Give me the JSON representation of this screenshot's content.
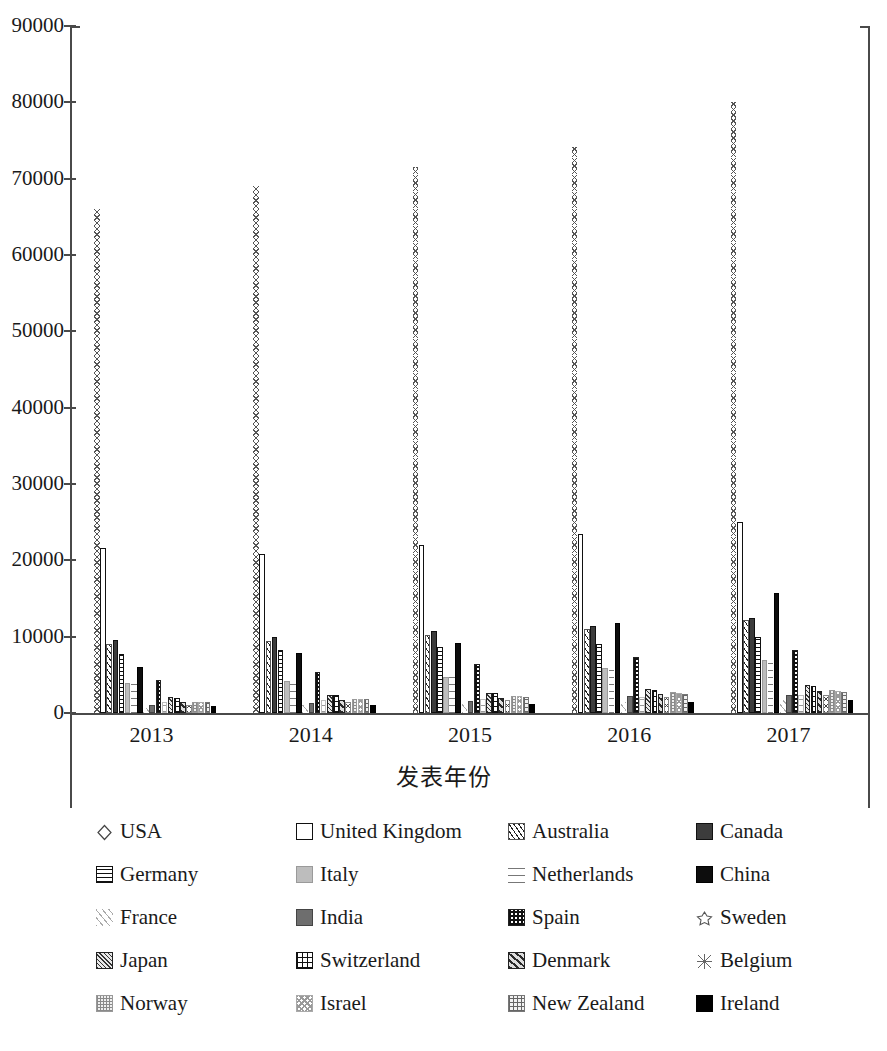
{
  "chart_data": {
    "type": "bar",
    "title": "",
    "xlabel": "发表年份",
    "ylabel": "",
    "categories": [
      "2013",
      "2014",
      "2015",
      "2016",
      "2017"
    ],
    "ylim": [
      0,
      90000
    ],
    "ytick_values": [
      0,
      10000,
      20000,
      30000,
      40000,
      50000,
      60000,
      70000,
      80000,
      90000
    ],
    "ytick_labels": [
      "0",
      "10000",
      "20000",
      "30000",
      "40000",
      "50000",
      "60000",
      "70000",
      "80000",
      "90000"
    ],
    "grid": false,
    "legend_position": "bottom",
    "series": [
      {
        "name": "USA",
        "values": [
          66000,
          69000,
          71500,
          74200,
          80000
        ]
      },
      {
        "name": "United Kingdom",
        "values": [
          21600,
          20800,
          22000,
          23500,
          25000
        ]
      },
      {
        "name": "Australia",
        "values": [
          9000,
          9400,
          10200,
          11000,
          12200
        ]
      },
      {
        "name": "Canada",
        "values": [
          9500,
          9900,
          10800,
          11400,
          12400
        ]
      },
      {
        "name": "Germany",
        "values": [
          7700,
          8200,
          8700,
          9100,
          9900
        ]
      },
      {
        "name": "Italy",
        "values": [
          3900,
          4200,
          4700,
          5900,
          6900
        ]
      },
      {
        "name": "Netherlands",
        "values": [
          4100,
          4400,
          4900,
          6000,
          7000
        ]
      },
      {
        "name": "China",
        "values": [
          6000,
          7900,
          9200,
          11800,
          15700
        ]
      },
      {
        "name": "France",
        "values": [
          700,
          1000,
          1300,
          1500,
          1700
        ]
      },
      {
        "name": "India",
        "values": [
          1100,
          1300,
          1600,
          2200,
          2300
        ]
      },
      {
        "name": "Spain",
        "values": [
          4300,
          5400,
          6400,
          7300,
          8200
        ]
      },
      {
        "name": "Sweden",
        "values": [
          1500,
          1700,
          1900,
          2100,
          2300
        ]
      },
      {
        "name": "Japan",
        "values": [
          2100,
          2300,
          2600,
          3100,
          3700
        ]
      },
      {
        "name": "Switzerland",
        "values": [
          2000,
          2300,
          2600,
          3000,
          3500
        ]
      },
      {
        "name": "Denmark",
        "values": [
          1400,
          1700,
          2000,
          2500,
          2900
        ]
      },
      {
        "name": "Belgium",
        "values": [
          1100,
          1400,
          1700,
          2100,
          2400
        ]
      },
      {
        "name": "Norway",
        "values": [
          1500,
          1900,
          2200,
          2700,
          3000
        ]
      },
      {
        "name": "Israel",
        "values": [
          1500,
          1900,
          2200,
          2600,
          2900
        ]
      },
      {
        "name": "New Zealand",
        "values": [
          1400,
          1800,
          2100,
          2500,
          2800
        ]
      },
      {
        "name": "Ireland",
        "values": [
          900,
          1100,
          1200,
          1500,
          1700
        ]
      }
    ]
  },
  "legend": {
    "items": [
      {
        "label": "USA",
        "marker": "diamond-outline-swatch"
      },
      {
        "label": "United Kingdom",
        "marker": "white-box-swatch"
      },
      {
        "label": "Australia",
        "marker": "forward-hatch-swatch"
      },
      {
        "label": "Canada",
        "marker": "dark-gray-solid-swatch"
      },
      {
        "label": "Germany",
        "marker": "grid-cross-swatch"
      },
      {
        "label": "Italy",
        "marker": "light-gray-solid-swatch"
      },
      {
        "label": "Netherlands",
        "marker": "horizontal-lines-swatch"
      },
      {
        "label": "China",
        "marker": "black-solid-swatch"
      },
      {
        "label": "France",
        "marker": "light-diagonal-swatch"
      },
      {
        "label": "India",
        "marker": "mid-gray-solid-swatch"
      },
      {
        "label": "Spain",
        "marker": "checkerboard-swatch"
      },
      {
        "label": "Sweden",
        "marker": "sparse-dot-swatch"
      },
      {
        "label": "Japan",
        "marker": "dense-diagonal-swatch"
      },
      {
        "label": "Switzerland",
        "marker": "brick-grid-swatch"
      },
      {
        "label": "Denmark",
        "marker": "wide-diagonal-swatch"
      },
      {
        "label": "Belgium",
        "marker": "cross-diagonal-swatch"
      },
      {
        "label": "Norway",
        "marker": "speckle-swatch"
      },
      {
        "label": "Israel",
        "marker": "light-checker-swatch"
      },
      {
        "label": "New Zealand",
        "marker": "fine-grid-swatch"
      },
      {
        "label": "Ireland",
        "marker": "solid-black-swatch"
      }
    ]
  }
}
